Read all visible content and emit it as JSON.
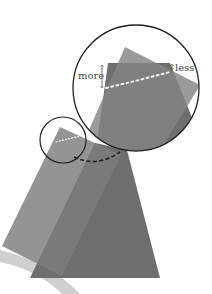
{
  "labels": {
    "more": "more",
    "less": "less"
  },
  "colors": {
    "background": "#ffffff",
    "swoosh": "#cfcfcf",
    "back_shape": "#6e6e6e",
    "front_shape": "#7c7c7c",
    "front_shape_opacity": "0.82",
    "magnified_back": "#6f6f6f",
    "magnified_front": "#848484",
    "circle_stroke": "#222222",
    "dashed_arc": "#1e1e1e",
    "dotted_line": "#f2f2f2",
    "label_text": "#4a4a4a"
  },
  "geometry": {
    "swoosh_path": "M 0 250 Q 50 262 80 294 L 62 294 Q 38 270 0 262 Z",
    "back_shape_points": "95,143 127,150 160,278 30,278",
    "front_shape_points": "60,127 121,155 62,276 2,246",
    "small_circle": {
      "cx": "63",
      "cy": "140",
      "r": "23"
    },
    "big_circle": {
      "cx": "136",
      "cy": "88",
      "r": "63"
    },
    "dashed_arc_path": "M 74 157 Q 97 168 120 152",
    "small_dotted_path": "M 56 142 L 80 136",
    "big_back_points": "108,63 170,63 205,150 96,150",
    "big_front_points": "125,47 200,85 160,151 80,151",
    "big_dotted_path": "M 106 88 Q 140 80 170 72",
    "more_arrow": {
      "x": "102",
      "y1": "65",
      "y2": "88"
    },
    "less_arrow": {
      "x": "172",
      "y1": "64",
      "y2": "70"
    },
    "more_label_pos": {
      "x": "78",
      "y": "79"
    },
    "less_label_pos": {
      "x": "175",
      "y": "71"
    }
  }
}
